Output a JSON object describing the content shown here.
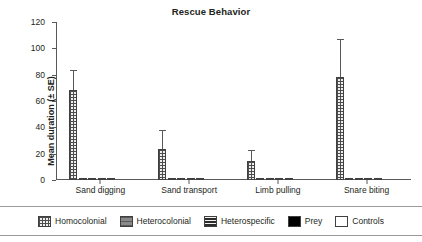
{
  "chart_data": {
    "type": "bar",
    "title": "Rescue Behavior",
    "xlabel": "",
    "ylabel": "Mean duration (± SE)",
    "ylim": [
      0,
      120
    ],
    "yticks": [
      0,
      20,
      40,
      60,
      80,
      100,
      120
    ],
    "grid": false,
    "legend_position": "bottom",
    "categories": [
      "Sand digging",
      "Sand transport",
      "Limb pulling",
      "Snare biting"
    ],
    "series": [
      {
        "name": "Homocolonial",
        "pattern": "grid",
        "values": [
          68,
          23.5,
          14.5,
          78.5
        ],
        "errors": [
          14.5,
          13.5,
          7.5,
          27.5
        ]
      },
      {
        "name": "Heterocolonial",
        "pattern": "gray-horizontal",
        "values": [
          0.4,
          0.4,
          0.4,
          0.4
        ],
        "errors": [
          0,
          0,
          0,
          0
        ]
      },
      {
        "name": "Heterospecific",
        "pattern": "dark-horizontal",
        "values": [
          0.4,
          0.4,
          0.4,
          0.4
        ],
        "errors": [
          0,
          0,
          0,
          0
        ]
      },
      {
        "name": "Prey",
        "pattern": "solid-black",
        "values": [
          0.4,
          0.4,
          0.4,
          0.4
        ],
        "errors": [
          0,
          0,
          0,
          0
        ]
      },
      {
        "name": "Controls",
        "pattern": "white",
        "values": [
          0.4,
          0.4,
          0.4,
          0.4
        ],
        "errors": [
          0,
          0,
          0,
          0
        ]
      }
    ]
  },
  "legend": {
    "items": [
      {
        "label": "Homocolonial",
        "pattern": "grid"
      },
      {
        "label": "Heterocolonial",
        "pattern": "gray-horizontal"
      },
      {
        "label": "Heterospecific",
        "pattern": "dark-horizontal"
      },
      {
        "label": "Prey",
        "pattern": "solid-black"
      },
      {
        "label": "Controls",
        "pattern": "white"
      }
    ]
  },
  "colors": {
    "axis": "#58595b",
    "text": "#231f20",
    "bar_outline": "#404041"
  }
}
